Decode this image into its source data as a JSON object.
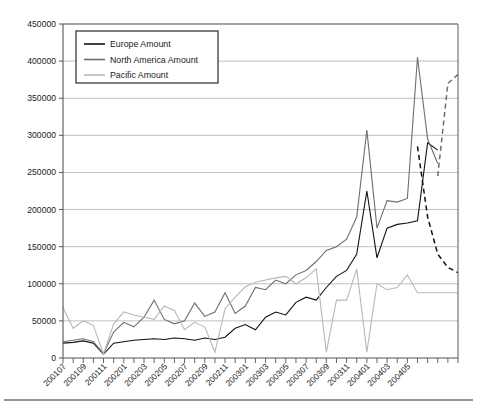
{
  "chart_data": {
    "type": "line",
    "title": "",
    "subtitle": "",
    "xlabel": "",
    "ylabel": "",
    "ylim": [
      0,
      450000
    ],
    "ytick_step": 50000,
    "ytick_labels": [
      "0",
      "50000",
      "100000",
      "150000",
      "200000",
      "250000",
      "300000",
      "350000",
      "400000",
      "450000"
    ],
    "grid": true,
    "legend_position": "top-left",
    "x": [
      "200107",
      "200108",
      "200109",
      "200110",
      "200111",
      "200112",
      "200201",
      "200202",
      "200203",
      "200204",
      "200205",
      "200206",
      "200207",
      "200208",
      "200209",
      "200210",
      "200211",
      "200212",
      "200301",
      "200302",
      "200303",
      "200304",
      "200305",
      "200306",
      "200307",
      "200308",
      "200309",
      "200310",
      "200311",
      "200312",
      "200401",
      "200402",
      "200403",
      "200404",
      "200405",
      "200406",
      "200407",
      "200408",
      "200409",
      "200410"
    ],
    "xtick_labels": [
      "200107",
      "200109",
      "200111",
      "200201",
      "200203",
      "200205",
      "200207",
      "200209",
      "200211",
      "200301",
      "200303",
      "200305",
      "200307",
      "200309",
      "200311",
      "200401",
      "200403",
      "200405"
    ],
    "xtick_label_every": 2,
    "xtick_minor": "monthly",
    "series": [
      {
        "name": "Europe Amount",
        "color": "#111111",
        "style": "solid",
        "values": [
          20000,
          21000,
          23000,
          20000,
          5000,
          20000,
          22000,
          24000,
          25000,
          26000,
          25000,
          27000,
          26000,
          24000,
          27000,
          25000,
          28000,
          40000,
          45000,
          38000,
          55000,
          62000,
          58000,
          75000,
          82000,
          78000,
          95000,
          110000,
          118000,
          140000,
          225000,
          135000,
          175000,
          180000,
          182000,
          185000,
          290000,
          280000,
          null,
          null
        ]
      },
      {
        "name": "Europe Amount Trend",
        "color": "#111111",
        "style": "dashed",
        "values": [
          null,
          null,
          null,
          null,
          null,
          null,
          null,
          null,
          null,
          null,
          null,
          null,
          null,
          null,
          null,
          null,
          null,
          null,
          null,
          null,
          null,
          null,
          null,
          null,
          null,
          null,
          null,
          null,
          null,
          null,
          null,
          null,
          null,
          null,
          null,
          285000,
          190000,
          140000,
          122000,
          115000
        ]
      },
      {
        "name": "North America Amount",
        "color": "#6e6e6e",
        "style": "solid",
        "values": [
          22000,
          24000,
          26000,
          22000,
          6000,
          35000,
          48000,
          42000,
          55000,
          78000,
          52000,
          46000,
          50000,
          74000,
          56000,
          62000,
          88000,
          60000,
          70000,
          95000,
          92000,
          105000,
          100000,
          112000,
          118000,
          130000,
          145000,
          150000,
          160000,
          190000,
          307000,
          175000,
          212000,
          210000,
          215000,
          405000,
          295000,
          262000,
          null,
          null
        ]
      },
      {
        "name": "North America Amount Trend",
        "color": "#6e6e6e",
        "style": "dashed",
        "values": [
          null,
          null,
          null,
          null,
          null,
          null,
          null,
          null,
          null,
          null,
          null,
          null,
          null,
          null,
          null,
          null,
          null,
          null,
          null,
          null,
          null,
          null,
          null,
          null,
          null,
          null,
          null,
          null,
          null,
          null,
          null,
          null,
          null,
          null,
          null,
          null,
          null,
          245000,
          370000,
          382000
        ]
      },
      {
        "name": "Pacific Amount",
        "color": "#b8b8b8",
        "style": "solid",
        "values": [
          68000,
          40000,
          50000,
          44000,
          5000,
          46000,
          62000,
          58000,
          55000,
          52000,
          70000,
          64000,
          38000,
          48000,
          42000,
          8000,
          66000,
          82000,
          96000,
          102000,
          105000,
          108000,
          110000,
          100000,
          108000,
          120000,
          8000,
          78000,
          78000,
          120000,
          8000,
          100000,
          92000,
          95000,
          112000,
          88000,
          88000,
          88000,
          88000,
          88000
        ]
      }
    ]
  },
  "legend": {
    "items": [
      {
        "label": "Europe Amount",
        "color": "#111111"
      },
      {
        "label": "North America Amount",
        "color": "#6e6e6e"
      },
      {
        "label": "Pacific Amount",
        "color": "#b8b8b8"
      }
    ]
  },
  "colors": {
    "grid": "#b9b9b9",
    "axis": "#555555",
    "plot_background": "#ffffff",
    "page_background": "#ffffff",
    "footer_rule": "#2a2a2a"
  }
}
